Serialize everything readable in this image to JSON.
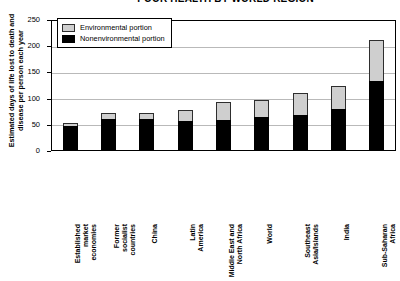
{
  "chart_data": {
    "type": "bar",
    "title": "POOR HEALTH BY WORLD REGION",
    "xlabel": "",
    "ylabel": "Estimated days of life lost to death and disease per person each year",
    "ylim": [
      0,
      250
    ],
    "yticks": [
      0,
      50,
      100,
      150,
      200,
      250
    ],
    "grid": true,
    "stacked": true,
    "legend_position": "top-left",
    "categories": [
      "Established market economies",
      "Former socialist countries",
      "China",
      "Latin America",
      "Middle East and North Africa",
      "World",
      "Southeast Asia/Islands",
      "India",
      "Sub-Saharan Africa"
    ],
    "series": [
      {
        "name": "Nonenvironmental portion",
        "color": "#000000",
        "values": [
          47,
          61,
          61,
          57,
          59,
          65,
          68,
          80,
          133
        ]
      },
      {
        "name": "Environmental portion",
        "color": "#cfcfcf",
        "values": [
          6,
          11,
          11,
          21,
          34,
          32,
          42,
          44,
          78
        ]
      }
    ],
    "totals": [
      53,
      72,
      72,
      78,
      93,
      97,
      110,
      124,
      211
    ]
  },
  "axis": {
    "y_title": "Estimated days of life lost to death and disease per person each year",
    "tick_labels": [
      "250",
      "200",
      "150",
      "100",
      "50",
      "0"
    ]
  },
  "legend": {
    "items": [
      {
        "label": "Environmental portion",
        "color": "#cfcfcf"
      },
      {
        "label": "Nonenvironmental portion",
        "color": "#000000"
      }
    ]
  },
  "xlabels": [
    "Established\nmarket\neconomies",
    "Former\nsocialist\ncountries",
    "China",
    "Latin\nAmerica",
    "Middle East and\nNorth Africa",
    "World",
    "Southeast\nAsia/Islands",
    "India",
    "Sub-Saharan\nAfrica"
  ]
}
